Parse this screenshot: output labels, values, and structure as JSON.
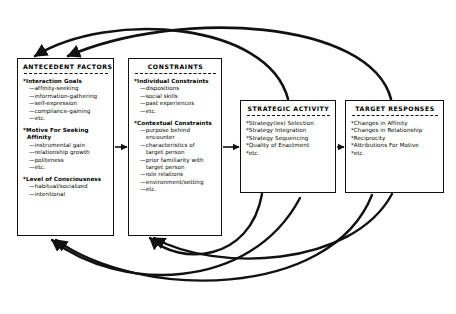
{
  "diagram": {
    "stroke_color": "#111111",
    "background_color": "#ffffff"
  },
  "boxes": [
    {
      "id": "antecedent-factors",
      "title": "ANTECEDENT FACTORS",
      "groups": [
        {
          "heading": "*Interaction Goals",
          "items": [
            "—affinity-seeking",
            "—information-gathering",
            "—self-expression",
            "—compliance-gaining",
            "—etc."
          ]
        },
        {
          "heading": "*Motive For Seeking",
          "heading_line2": "Affinity",
          "items": [
            "—instrumental gain",
            "—relationship growth",
            "—politeness",
            "—etc."
          ]
        },
        {
          "heading": "*Level of Consciousness",
          "items": [
            "—habitual/socialized",
            "—intentional"
          ]
        }
      ]
    },
    {
      "id": "constraints",
      "title": "CONSTRAINTS",
      "groups": [
        {
          "heading": "*Individual Constraints",
          "items": [
            "—dispositions",
            "—social skills",
            "—past experiences",
            "—etc."
          ]
        },
        {
          "heading": "*Contextual Constraints",
          "items": [
            "—purpose behind",
            "encounter",
            "—characteristics of",
            "target person",
            "—prior familiarity with",
            "target person",
            "—role relations",
            "—environment/setting",
            "—etc."
          ]
        }
      ]
    },
    {
      "id": "strategic-activity",
      "title": "STRATEGIC ACTIVITY",
      "items": [
        "*Strategy(ies) Selection",
        "*Strategy Integration",
        "*Strategy Sequencing",
        "*Quality of Enactment",
        "*etc."
      ]
    },
    {
      "id": "target-responses",
      "title": "TARGET RESPONSES",
      "items": [
        "*Changes in Affinity",
        "*Changes in Relationship",
        "*Reciprocity",
        "*Attributions For Motive",
        "*etc."
      ]
    }
  ],
  "connectors": {
    "forward": [
      {
        "name": "antecedent-to-constraints",
        "from": "antecedent-factors",
        "to": "constraints"
      },
      {
        "name": "constraints-to-strategic",
        "from": "constraints",
        "to": "strategic-activity"
      },
      {
        "name": "strategic-to-target",
        "from": "strategic-activity",
        "to": "target-responses"
      }
    ],
    "feedback": [
      {
        "name": "target-to-antecedent-top",
        "from": "target-responses",
        "to": "antecedent-factors"
      },
      {
        "name": "strategic-to-constraints-top",
        "from": "strategic-activity",
        "to": "constraints"
      },
      {
        "name": "strategic-to-constraints-bottom",
        "from": "strategic-activity",
        "to": "constraints"
      },
      {
        "name": "target-to-antecedent-bottom",
        "from": "target-responses",
        "to": "antecedent-factors"
      },
      {
        "name": "target-to-constraints-bottom",
        "from": "target-responses",
        "to": "constraints"
      }
    ]
  }
}
